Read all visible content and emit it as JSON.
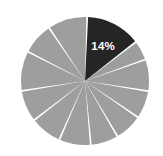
{
  "chart_data": {
    "type": "pie",
    "title": "",
    "xlabel": "",
    "ylabel": "",
    "grid": false,
    "legend": "none",
    "center": {
      "cx": 85,
      "cy": 81
    },
    "radius": 64,
    "start_angle_deg": -88,
    "slice_gap_deg": 1.6,
    "highlight_color": "#252525",
    "base_color": "#9e9e9e",
    "divider_color": "#ffffff",
    "background_color": "#ffffff",
    "label_color": "#ffffff",
    "categories": [
      "S1",
      "S2",
      "S3",
      "S4",
      "S5",
      "S6",
      "S7",
      "S8",
      "S9",
      "S10",
      "S11",
      "S12"
    ],
    "values": [
      14,
      5,
      8,
      7,
      7,
      7,
      8,
      8,
      8,
      10,
      8,
      10
    ],
    "labels": [
      "14%",
      "",
      "",
      "",
      "",
      "",
      "",
      "",
      "",
      "",
      "",
      ""
    ],
    "colors": [
      "#252525",
      "#9e9e9e",
      "#9e9e9e",
      "#9e9e9e",
      "#9e9e9e",
      "#9e9e9e",
      "#9e9e9e",
      "#9e9e9e",
      "#9e9e9e",
      "#9e9e9e",
      "#9e9e9e",
      "#9e9e9e"
    ],
    "annotations": [
      {
        "text": "14%",
        "slice_index": 0,
        "radius_frac": 0.62
      }
    ]
  }
}
